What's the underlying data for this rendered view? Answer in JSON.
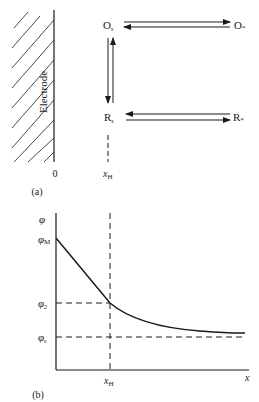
{
  "panel_a": {
    "label": "(a)",
    "electrode_label": "Electrode",
    "origin_label": "0",
    "xh_label": "x",
    "xh_sub": "H",
    "species": {
      "o_surface": "O",
      "o_surface_sub": "s",
      "o_bulk": "O",
      "o_bulk_sub": "*",
      "r_surface": "R",
      "r_surface_sub": "s",
      "r_bulk": "R",
      "r_bulk_sub": "*"
    }
  },
  "panel_b": {
    "label": "(b)",
    "y_axis_label": "φ",
    "x_axis_label": "x",
    "phi_m": "φ",
    "phi_m_sub": "M",
    "phi_2": "φ",
    "phi_2_sub": "2",
    "phi_s": "φ",
    "phi_s_sub": "s",
    "xh_label": "x",
    "xh_sub": "H"
  },
  "colors": {
    "ink": "#1a1a1a",
    "background": "#ffffff"
  }
}
